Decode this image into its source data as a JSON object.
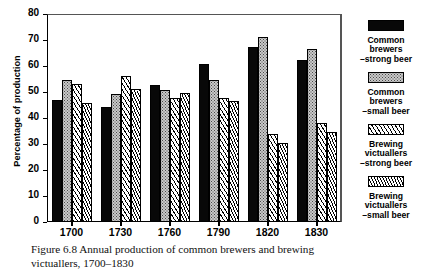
{
  "figure": {
    "caption_line1": "Figure 6.8  Annual production of common brewers and brewing",
    "caption_line2": "victuallers, 1700–1830"
  },
  "legend": {
    "items": [
      {
        "swatch": "solid-black-swatch",
        "line1": "Common",
        "line2": "brewers",
        "line3": "–strong beer"
      },
      {
        "swatch": "dotted-grey-swatch",
        "line1": "Common",
        "line2": "brewers",
        "line3": "–small beer"
      },
      {
        "swatch": "hatch-wide-swatch",
        "line1": "Brewing",
        "line2": "victuallers",
        "line3": "–strong beer"
      },
      {
        "swatch": "hatch-dense-swatch",
        "line1": "Brewing",
        "line2": "victuallers",
        "line3": "–small beer"
      }
    ]
  },
  "chart_data": {
    "type": "bar",
    "title": "",
    "xlabel": "",
    "ylabel": "Percentage of production",
    "ylim": [
      0,
      80
    ],
    "yticks": [
      0,
      10,
      20,
      30,
      40,
      50,
      60,
      70,
      80
    ],
    "grid": false,
    "legend_position": "right",
    "categories": [
      "1700",
      "1730",
      "1760",
      "1790",
      "1820",
      "1830"
    ],
    "series": [
      {
        "name": "Common brewers –strong beer",
        "pattern": "solid-black",
        "values": [
          47.0,
          44.1,
          52.8,
          60.8,
          67.2,
          62.5
        ]
      },
      {
        "name": "Common brewers –small beer",
        "pattern": "dotted-grey",
        "values": [
          54.5,
          49.3,
          50.8,
          54.5,
          71.0,
          66.6
        ]
      },
      {
        "name": "Brewing victuallers –strong beer",
        "pattern": "hatch-wide",
        "values": [
          52.9,
          56.1,
          47.6,
          47.8,
          33.9,
          38.2
        ]
      },
      {
        "name": "Brewing victuallers –small beer",
        "pattern": "hatch-dense",
        "values": [
          45.6,
          51.0,
          49.8,
          46.7,
          30.2,
          34.6
        ]
      }
    ]
  }
}
